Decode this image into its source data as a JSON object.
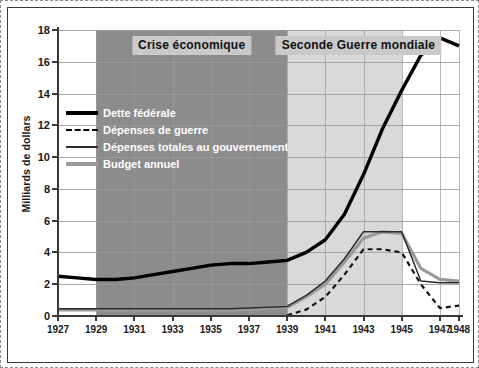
{
  "chart_data": {
    "type": "line",
    "title": "",
    "xlabel": "",
    "ylabel": "Milliards de dollars",
    "xlim": [
      1927,
      1948
    ],
    "ylim": [
      0,
      18
    ],
    "yticks": [
      0,
      2,
      4,
      6,
      8,
      10,
      12,
      14,
      16,
      18
    ],
    "xticks": [
      1927,
      1929,
      1931,
      1933,
      1935,
      1937,
      1939,
      1941,
      1943,
      1945,
      1947,
      1948
    ],
    "grid": true,
    "legend_position": "upper-left-inside",
    "x": [
      1927,
      1928,
      1929,
      1930,
      1931,
      1932,
      1933,
      1934,
      1935,
      1936,
      1937,
      1938,
      1939,
      1940,
      1941,
      1942,
      1943,
      1944,
      1945,
      1946,
      1947,
      1948
    ],
    "series": [
      {
        "name": "Dette fédérale",
        "style": "solid-thick",
        "color": "#000000",
        "values": [
          2.5,
          2.4,
          2.3,
          2.3,
          2.4,
          2.6,
          2.8,
          3.0,
          3.2,
          3.3,
          3.3,
          3.4,
          3.5,
          4.0,
          4.8,
          6.4,
          8.9,
          11.8,
          14.2,
          16.4,
          17.5,
          17.0
        ]
      },
      {
        "name": "Dépenses de guerre",
        "style": "dashed",
        "color": "#111111",
        "values": [
          null,
          null,
          null,
          null,
          null,
          null,
          null,
          null,
          null,
          null,
          null,
          null,
          0.05,
          0.4,
          1.2,
          2.6,
          4.2,
          4.2,
          4.0,
          2.0,
          0.5,
          0.65
        ]
      },
      {
        "name": "Dépenses totales au gouvernement",
        "style": "solid-thin",
        "color": "#2b2b2b",
        "values": [
          0.45,
          0.45,
          0.45,
          0.45,
          0.45,
          0.45,
          0.45,
          0.45,
          0.45,
          0.45,
          0.5,
          0.55,
          0.6,
          1.3,
          2.2,
          3.6,
          5.3,
          5.3,
          5.3,
          2.2,
          2.1,
          2.1
        ]
      },
      {
        "name": "Budget annuel",
        "style": "solid-thick-gray",
        "color": "#9a9a9a",
        "values": [
          0.38,
          0.38,
          0.38,
          0.38,
          0.38,
          0.38,
          0.38,
          0.38,
          0.38,
          0.38,
          0.42,
          0.5,
          0.55,
          1.2,
          2.0,
          3.4,
          4.9,
          5.3,
          5.2,
          3.0,
          2.3,
          2.2
        ]
      }
    ],
    "bands": [
      {
        "label": "Crise économique",
        "start": 1929,
        "end": 1939,
        "color": "#8c8c8c"
      },
      {
        "label": "Seconde Guerre mondiale",
        "start": 1939,
        "end": 1945,
        "color": "#d9d9d9"
      }
    ]
  },
  "axis": {
    "y_title": "Milliards de dollars",
    "y_labels": [
      "18",
      "16",
      "14",
      "12",
      "10",
      "8",
      "6",
      "4",
      "2",
      "0"
    ],
    "x_labels": [
      "1927",
      "1929",
      "1931",
      "1933",
      "1935",
      "1937",
      "1939",
      "1941",
      "1943",
      "1945",
      "1947",
      "1948"
    ]
  },
  "legend": {
    "items": [
      {
        "label": "Dette fédérale"
      },
      {
        "label": "Dépenses de guerre"
      },
      {
        "label": "Dépenses totales au gouvernement"
      },
      {
        "label": "Budget annuel"
      }
    ]
  },
  "bands": {
    "crise_label": "Crise économique",
    "guerre_label": "Seconde Guerre mondiale"
  }
}
